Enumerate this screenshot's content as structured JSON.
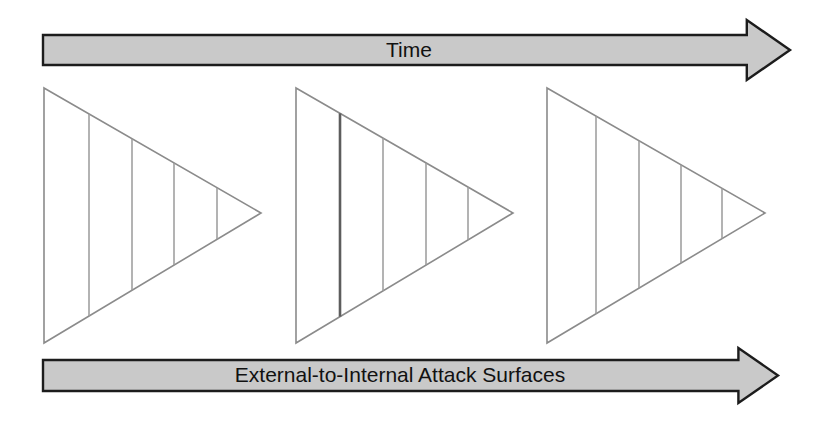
{
  "diagram": {
    "background_color": "#ffffff",
    "width": 818,
    "height": 421
  },
  "arrows": {
    "top": {
      "label": "Time",
      "fill_color": "#c9c9c9",
      "stroke_color": "#1c1c1c",
      "direction": "right",
      "shaft": {
        "x": 43,
        "y": 35,
        "width": 707,
        "height": 30
      },
      "head": {
        "tip_x": 790,
        "top_y": 20,
        "bottom_y": 80
      },
      "label_x": 409,
      "label_y": 50
    },
    "bottom": {
      "label": "External-to-Internal Attack Surfaces",
      "fill_color": "#c9c9c9",
      "stroke_color": "#1c1c1c",
      "direction": "right",
      "shaft": {
        "x": 43,
        "y": 360,
        "width": 695,
        "height": 31
      },
      "head": {
        "tip_x": 778,
        "top_y": 348,
        "bottom_y": 403
      },
      "label_x": 400,
      "label_y": 375
    }
  },
  "triangles": [
    {
      "name": "attack-surface-triangle-1",
      "stage": 1,
      "left_x": 44,
      "top_y": 88,
      "bottom_y": 343,
      "tip_x": 261,
      "tip_y": 213,
      "outline_color": "#8b8b8b",
      "fill_color": "#ffffff",
      "segments": 5,
      "dividers": [
        {
          "x": 89,
          "emphasis": "normal"
        },
        {
          "x": 132,
          "emphasis": "normal"
        },
        {
          "x": 174,
          "emphasis": "normal"
        },
        {
          "x": 217,
          "emphasis": "normal"
        }
      ]
    },
    {
      "name": "attack-surface-triangle-2",
      "stage": 2,
      "left_x": 296,
      "top_y": 88,
      "bottom_y": 343,
      "tip_x": 513,
      "tip_y": 213,
      "outline_color": "#8b8b8b",
      "fill_color": "#ffffff",
      "segments": 5,
      "dividers": [
        {
          "x": 340,
          "emphasis": "bold"
        },
        {
          "x": 383,
          "emphasis": "normal"
        },
        {
          "x": 426,
          "emphasis": "normal"
        },
        {
          "x": 468,
          "emphasis": "normal"
        }
      ]
    },
    {
      "name": "attack-surface-triangle-3",
      "stage": 3,
      "left_x": 547,
      "top_y": 88,
      "bottom_y": 343,
      "tip_x": 765,
      "tip_y": 213,
      "outline_color": "#8b8b8b",
      "fill_color": "#ffffff",
      "segments": 5,
      "dividers": [
        {
          "x": 596,
          "emphasis": "normal"
        },
        {
          "x": 639,
          "emphasis": "normal"
        },
        {
          "x": 681,
          "emphasis": "normal"
        },
        {
          "x": 722,
          "emphasis": "normal"
        }
      ]
    }
  ]
}
